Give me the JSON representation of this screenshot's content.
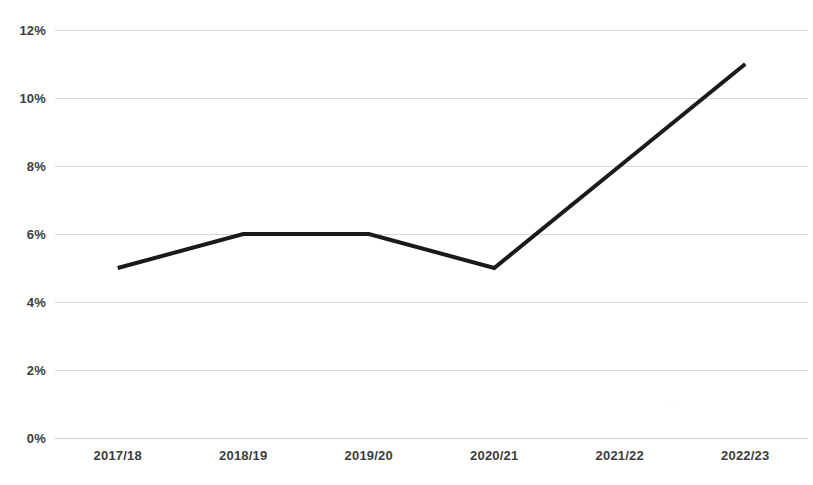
{
  "chart_data": {
    "type": "line",
    "title": "",
    "subtitle": "",
    "xlabel": "",
    "ylabel": "",
    "categories": [
      "2017/18",
      "2018/19",
      "2019/20",
      "2020/21",
      "2021/22",
      "2022/23"
    ],
    "values": [
      5,
      6,
      6,
      5,
      8,
      11
    ],
    "value_suffix": "%",
    "ylim": [
      0,
      12
    ],
    "ytick_values": [
      0,
      2,
      4,
      6,
      8,
      10,
      12
    ],
    "ytick_labels": [
      "0%",
      "2%",
      "4%",
      "6%",
      "8%",
      "10%",
      "12%"
    ],
    "series": [
      {
        "name": "",
        "values": [
          5,
          6,
          6,
          5,
          8,
          11
        ],
        "color": "#1a1a1a",
        "line_width": 4,
        "markers": false
      }
    ],
    "grid": {
      "horizontal": true,
      "vertical": false,
      "color": "#d9d9d9"
    },
    "legend": {
      "visible": false,
      "position": "none",
      "entries": []
    },
    "axis_line_color": "#cfcfcf",
    "background_color": "#ffffff",
    "tick_label_color": "#3d3d3d"
  },
  "artifacts": {
    "smudge_text": "~"
  }
}
